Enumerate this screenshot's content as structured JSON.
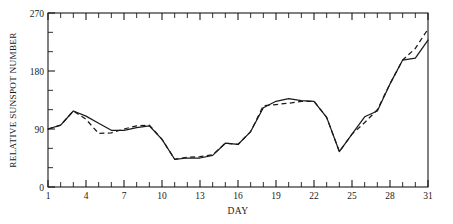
{
  "chart_data": {
    "type": "line",
    "title": "",
    "xlabel": "DAY",
    "ylabel": "RELATIVE SUNSPOT NUMBER",
    "xlim": [
      1,
      31
    ],
    "ylim": [
      0,
      270
    ],
    "grid": false,
    "legend": "none",
    "x_ticks_labeled": [
      1,
      4,
      7,
      10,
      13,
      16,
      19,
      22,
      25,
      28,
      31
    ],
    "y_ticks_labeled": [
      0,
      90,
      180,
      270
    ],
    "y_ticks_minor": [
      30,
      60,
      120,
      150,
      210,
      240
    ],
    "x_tick_interval_minor": 1,
    "x": [
      1,
      2,
      3,
      4,
      5,
      6,
      7,
      8,
      9,
      10,
      11,
      12,
      13,
      14,
      15,
      16,
      17,
      18,
      19,
      20,
      21,
      22,
      23,
      24,
      25,
      26,
      27,
      28,
      29,
      30,
      31
    ],
    "series": [
      {
        "name": "observed",
        "style": "solid",
        "values": [
          90,
          96,
          118,
          110,
          99,
          88,
          88,
          92,
          95,
          74,
          43,
          45,
          45,
          49,
          68,
          66,
          86,
          123,
          133,
          137,
          134,
          133,
          108,
          55,
          82,
          109,
          118,
          160,
          197,
          200,
          228
        ]
      },
      {
        "name": "predicted",
        "style": "dashed",
        "values": [
          90,
          96,
          118,
          105,
          83,
          84,
          90,
          95,
          96,
          74,
          43,
          46,
          47,
          50,
          68,
          66,
          86,
          126,
          128,
          130,
          133,
          133,
          108,
          55,
          82,
          100,
          120,
          160,
          197,
          215,
          245
        ]
      }
    ]
  },
  "labels": {
    "y_axis_title": "RELATIVE SUNSPOT NUMBER",
    "x_axis_title": "DAY",
    "y_0": "0",
    "y_90": "90",
    "y_180": "180",
    "y_270": "270",
    "x_1": "1",
    "x_4": "4",
    "x_7": "7",
    "x_10": "10",
    "x_13": "13",
    "x_16": "16",
    "x_19": "19",
    "x_22": "22",
    "x_25": "25",
    "x_28": "28",
    "x_31": "31"
  },
  "colors": {
    "ink": "#1a1a1a",
    "background": "#ffffff"
  }
}
